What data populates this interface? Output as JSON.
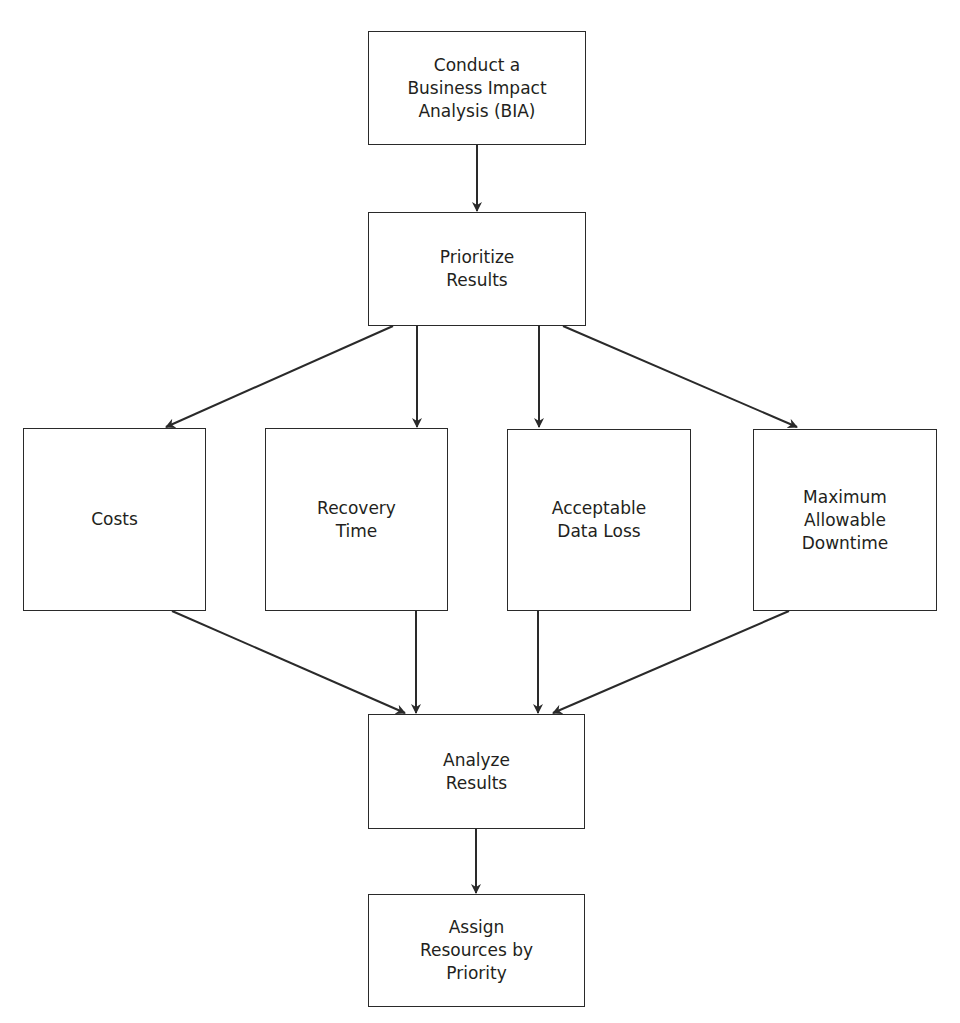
{
  "diagram": {
    "type": "flowchart",
    "nodes": [
      {
        "id": "bia",
        "label": "Conduct a\nBusiness Impact\nAnalysis (BIA)"
      },
      {
        "id": "prioritize",
        "label": "Prioritize\nResults"
      },
      {
        "id": "costs",
        "label": "Costs"
      },
      {
        "id": "recovery",
        "label": "Recovery\nTime"
      },
      {
        "id": "dataloss",
        "label": "Acceptable\nData Loss"
      },
      {
        "id": "downtime",
        "label": "Maximum\nAllowable\nDowntime"
      },
      {
        "id": "analyze",
        "label": "Analyze\nResults"
      },
      {
        "id": "assign",
        "label": "Assign\nResources by\nPriority"
      }
    ],
    "edges": [
      {
        "from": "bia",
        "to": "prioritize"
      },
      {
        "from": "prioritize",
        "to": "costs"
      },
      {
        "from": "prioritize",
        "to": "recovery"
      },
      {
        "from": "prioritize",
        "to": "dataloss"
      },
      {
        "from": "prioritize",
        "to": "downtime"
      },
      {
        "from": "costs",
        "to": "analyze"
      },
      {
        "from": "recovery",
        "to": "analyze"
      },
      {
        "from": "dataloss",
        "to": "analyze"
      },
      {
        "from": "downtime",
        "to": "analyze"
      },
      {
        "from": "analyze",
        "to": "assign"
      }
    ],
    "colors": {
      "line": "#2a2a2a",
      "text": "#231f20",
      "background": "#ffffff"
    }
  }
}
